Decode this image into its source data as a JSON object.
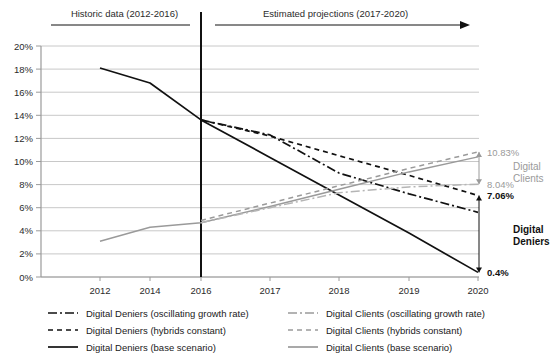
{
  "chart_data": {
    "type": "line",
    "title": "",
    "xlabel": "",
    "ylabel": "",
    "x": [
      2012,
      2013,
      2014,
      2015,
      2016,
      2017,
      2018,
      2019,
      2020
    ],
    "tick_labels": [
      "2012",
      "2014",
      "2016",
      "2017",
      "2018",
      "2019",
      "2020"
    ],
    "tick_values": [
      2012,
      2014,
      2016,
      2017,
      2018,
      2019,
      2020
    ],
    "ylim": [
      0,
      20
    ],
    "ytick_labels": [
      "0%",
      "2%",
      "4%",
      "6%",
      "8%",
      "10%",
      "12%",
      "14%",
      "16%",
      "18%",
      "20%"
    ],
    "ytick_values": [
      0,
      2,
      4,
      6,
      8,
      10,
      12,
      14,
      16,
      18,
      20
    ],
    "grid": true,
    "legend_position": "bottom",
    "series": [
      {
        "name": "Digital Deniers (base scenario)",
        "key": "deniers_base",
        "style": "solid",
        "color": "#111111",
        "x": [
          2012,
          2014,
          2016,
          2017,
          2018,
          2019,
          2020
        ],
        "values": [
          18.1,
          16.8,
          13.6,
          10.35,
          7.1,
          3.8,
          0.4
        ]
      },
      {
        "name": "Digital Deniers (hybrids constant)",
        "key": "deniers_hybrids",
        "style": "dashed",
        "color": "#111111",
        "x": [
          2016,
          2017,
          2018,
          2019,
          2020
        ],
        "values": [
          13.6,
          12.2,
          10.5,
          8.8,
          7.06
        ]
      },
      {
        "name": "Digital Deniers (oscillating growth rate)",
        "key": "deniers_osc",
        "style": "dashdot",
        "color": "#111111",
        "x": [
          2016,
          2017,
          2018,
          2019,
          2020
        ],
        "values": [
          13.6,
          12.3,
          9.0,
          7.2,
          5.6
        ]
      },
      {
        "name": "Digital Clients (base scenario)",
        "key": "clients_base",
        "style": "solid",
        "color": "#9a9a9a",
        "x": [
          2012,
          2014,
          2016,
          2017,
          2018,
          2019,
          2020
        ],
        "values": [
          3.1,
          4.3,
          4.7,
          6.1,
          7.6,
          9.1,
          10.4
        ]
      },
      {
        "name": "Digital Clients (hybrids constant)",
        "key": "clients_hybrids",
        "style": "dashed",
        "color": "#9a9a9a",
        "x": [
          2016,
          2017,
          2018,
          2019,
          2020
        ],
        "values": [
          4.9,
          6.4,
          7.9,
          9.4,
          10.83
        ]
      },
      {
        "name": "Digital Clients (oscillating growth rate)",
        "key": "clients_osc",
        "style": "dashdot",
        "color": "#b5b5b5",
        "x": [
          2016,
          2017,
          2018,
          2019,
          2020
        ],
        "values": [
          4.7,
          6.0,
          7.3,
          7.8,
          8.04
        ]
      }
    ]
  },
  "header": {
    "historic_label": "Historic data (2012-2016)",
    "projection_label": "Estimated projections (2017-2020)"
  },
  "annotations": {
    "clients_high": "10.83%",
    "clients_low": "8.04%",
    "deniers_high": "7.06%",
    "deniers_low": "0.4%",
    "clients_group_line1": "Digital",
    "clients_group_line2": "Clients",
    "deniers_group_line1": "Digital",
    "deniers_group_line2": "Deniers"
  },
  "legend": {
    "left": [
      "Digital Deniers (oscillating growth rate)",
      "Digital Deniers (hybrids constant)",
      "Digital Deniers (base scenario)"
    ],
    "right": [
      "Digital Clients (oscillating growth rate)",
      "Digital Clients (hybrids constant)",
      "Digital Clients (base scenario)"
    ]
  },
  "colors": {
    "deniers": "#111111",
    "clients": "#9a9a9a",
    "grid": "#c8c8c8",
    "axis": "#9a9a9a"
  }
}
